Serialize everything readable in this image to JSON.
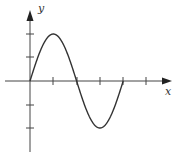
{
  "chart_data": {
    "type": "line",
    "title": "",
    "xlabel": "x",
    "ylabel": "y",
    "function": "y = 2 sin(pi x / 2)",
    "x": [
      0,
      0.5,
      1,
      1.5,
      2,
      2.5,
      3,
      3.5,
      4
    ],
    "series": [
      {
        "name": "curve",
        "values": [
          0,
          1.414,
          2,
          1.414,
          0,
          -1.414,
          -2,
          -1.414,
          0
        ]
      }
    ],
    "x_ticks": [
      1,
      2,
      3,
      4,
      5
    ],
    "y_ticks": [
      -2,
      -1,
      1,
      2
    ],
    "xlim": [
      -1,
      6
    ],
    "ylim": [
      -3,
      3
    ],
    "grid": false,
    "legend": "none"
  },
  "labels": {
    "x_axis": "x",
    "y_axis": "y"
  },
  "colors": {
    "axis": "#444444",
    "curve": "#333333"
  }
}
